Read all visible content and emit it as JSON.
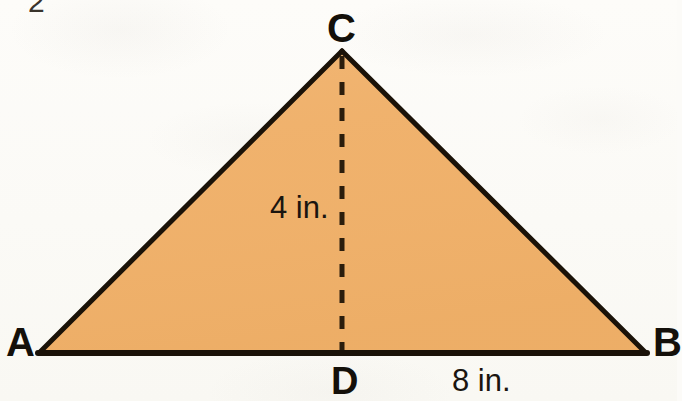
{
  "figure": {
    "type": "geometry-diagram",
    "shape": "triangle",
    "corner_mark": "2",
    "colors": {
      "fill": "#f0b26d",
      "stroke": "#1a1208",
      "background": "#fcfbf8",
      "label_text": "#14100a",
      "dashed_line": "#2b1d0c"
    },
    "vertices": [
      {
        "name": "A",
        "label": "A",
        "x": 40,
        "y": 352
      },
      {
        "name": "B",
        "label": "B",
        "x": 645,
        "y": 352
      },
      {
        "name": "C",
        "label": "C",
        "x": 342,
        "y": 51
      },
      {
        "name": "D",
        "label": "D",
        "x": 342,
        "y": 352
      }
    ],
    "segments": [
      {
        "name": "side-AC",
        "from": "A",
        "to": "C",
        "style": "solid"
      },
      {
        "name": "side-CB",
        "from": "C",
        "to": "B",
        "style": "solid"
      },
      {
        "name": "base-AB",
        "from": "A",
        "to": "B",
        "style": "solid"
      },
      {
        "name": "altitude-CD",
        "from": "C",
        "to": "D",
        "style": "dashed"
      }
    ],
    "measurements": {
      "height_label": "4 in.",
      "height_value": 4,
      "base_label": "8 in.",
      "base_value": 8,
      "unit": "in."
    }
  }
}
